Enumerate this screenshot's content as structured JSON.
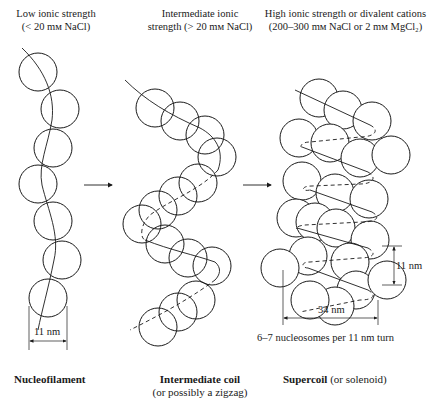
{
  "headers": {
    "left": {
      "line1": "Low ionic strength",
      "line2": "(< 20 mм NaCl)"
    },
    "middle": {
      "line1": "Intermediate ionic",
      "line2": "strength (> 20 mм NaCl)"
    },
    "right": {
      "line1": "High ionic strength or divalent cations",
      "line2": "(200–300 mм NaCl or 2 mм MgCl₂)"
    }
  },
  "dimensions": {
    "nucleofilament_width": "11 nm",
    "supercoil_pitch": "11 nm",
    "supercoil_width": "34 nm",
    "nucleosomes_per_turn": "6–7 nucleosomes per 11 nm turn"
  },
  "captions": {
    "left": {
      "bold": "Nucleofilament"
    },
    "middle": {
      "bold": "Intermediate coil",
      "sub": "(or possibly a zigzag)"
    },
    "right": {
      "bold": "Supercoil",
      "sub": " (or solenoid)"
    }
  },
  "arrows": [
    {
      "from": "nucleofilament",
      "to": "intermediate-coil"
    },
    {
      "from": "intermediate-coil",
      "to": "supercoil"
    }
  ],
  "structures": {
    "nucleofilament": {
      "radius": 19,
      "circles": [
        [
          38,
          72
        ],
        [
          60,
          109
        ],
        [
          53,
          148
        ],
        [
          38,
          184
        ],
        [
          53,
          221
        ],
        [
          62,
          260
        ],
        [
          48,
          298
        ]
      ]
    },
    "intermediate_coil": {
      "radius": 19,
      "circles": [
        [
          155,
          108
        ],
        [
          180,
          121
        ],
        [
          205,
          135
        ],
        [
          217,
          157
        ],
        [
          198,
          183
        ],
        [
          178,
          196
        ],
        [
          158,
          210
        ],
        [
          142,
          224
        ],
        [
          165,
          244
        ],
        [
          188,
          258
        ],
        [
          212,
          266
        ],
        [
          196,
          300
        ],
        [
          178,
          312
        ],
        [
          158,
          327
        ]
      ]
    },
    "supercoil": {
      "radius": 19,
      "circles": [
        [
          319,
          98
        ],
        [
          343,
          110
        ],
        [
          372,
          121
        ],
        [
          299,
          138
        ],
        [
          330,
          143
        ],
        [
          360,
          158
        ],
        [
          391,
          155
        ],
        [
          302,
          181
        ],
        [
          335,
          193
        ],
        [
          369,
          199
        ],
        [
          296,
          218
        ],
        [
          315,
          222
        ],
        [
          336,
          228
        ],
        [
          370,
          240
        ],
        [
          308,
          256
        ],
        [
          280,
          268
        ],
        [
          350,
          262
        ],
        [
          356,
          290
        ],
        [
          335,
          306
        ],
        [
          310,
          300
        ],
        [
          387,
          280
        ]
      ]
    }
  }
}
